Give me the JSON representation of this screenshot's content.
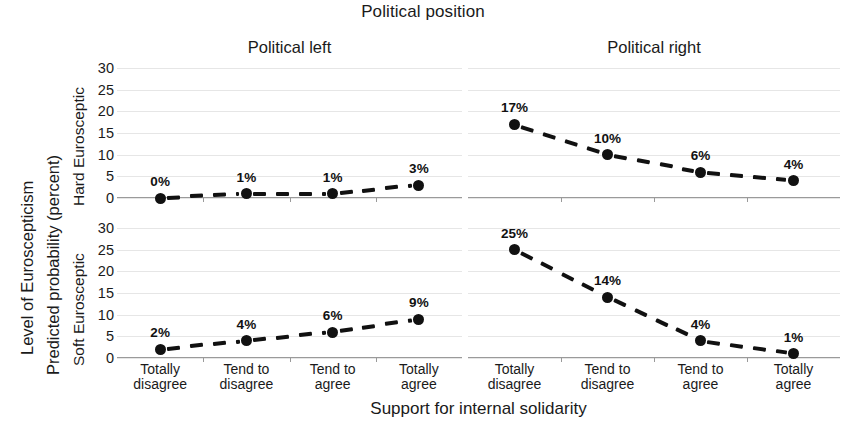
{
  "figure": {
    "title": "Political position",
    "x_axis_title": "Support for internal solidarity",
    "y_axis_title_outer": "Level of Euroscepticism",
    "y_axis_title_inner": "Predicted probability (percent)"
  },
  "panels": {
    "column_titles": [
      "Political left",
      "Political right"
    ],
    "row_titles": [
      "Hard Eurosceptic",
      "Soft Eurosceptic"
    ]
  },
  "axis": {
    "y_ticks": [
      "30",
      "25",
      "20",
      "15",
      "10",
      "5",
      "0"
    ],
    "x_ticks": [
      {
        "line1": "Totally",
        "line2": "disagree"
      },
      {
        "line1": "Tend to",
        "line2": "disagree"
      },
      {
        "line1": "Tend to",
        "line2": "agree"
      },
      {
        "line1": "Totally",
        "line2": "agree"
      }
    ]
  },
  "labels": {
    "hard_left": [
      "0%",
      "1%",
      "1%",
      "3%"
    ],
    "hard_right": [
      "17%",
      "10%",
      "6%",
      "4%"
    ],
    "soft_left": [
      "2%",
      "4%",
      "6%",
      "9%"
    ],
    "soft_right": [
      "25%",
      "14%",
      "4%",
      "1%"
    ]
  },
  "chart_data": {
    "type": "line",
    "title": "Political position",
    "xlabel": "Support for internal solidarity",
    "ylabel": "Level of Euroscepticism — Predicted probability (percent)",
    "categories": [
      "Totally disagree",
      "Tend to disagree",
      "Tend to agree",
      "Totally agree"
    ],
    "ylim": [
      0,
      30
    ],
    "yticks": [
      0,
      5,
      10,
      15,
      20,
      25,
      30
    ],
    "grid": true,
    "legend": "none",
    "layout": {
      "rows": [
        "Hard Eurosceptic",
        "Soft Eurosceptic"
      ],
      "cols": [
        "Political left",
        "Political right"
      ]
    },
    "panels": [
      {
        "row": "Hard Eurosceptic",
        "col": "Political left",
        "values": [
          0,
          1,
          1,
          3
        ],
        "labels": [
          "0%",
          "1%",
          "1%",
          "3%"
        ],
        "marker": "filled-circle",
        "linestyle": "dashed",
        "color": "#111111"
      },
      {
        "row": "Hard Eurosceptic",
        "col": "Political right",
        "values": [
          17,
          10,
          6,
          4
        ],
        "labels": [
          "17%",
          "10%",
          "6%",
          "4%"
        ],
        "marker": "filled-circle",
        "linestyle": "dashed",
        "color": "#111111"
      },
      {
        "row": "Soft Eurosceptic",
        "col": "Political left",
        "values": [
          2,
          4,
          6,
          9
        ],
        "labels": [
          "2%",
          "4%",
          "6%",
          "9%"
        ],
        "marker": "filled-circle",
        "linestyle": "dashed",
        "color": "#111111"
      },
      {
        "row": "Soft Eurosceptic",
        "col": "Political right",
        "values": [
          25,
          14,
          4,
          1
        ],
        "labels": [
          "25%",
          "14%",
          "4%",
          "1%"
        ],
        "marker": "filled-circle",
        "linestyle": "dashed",
        "color": "#111111"
      }
    ]
  }
}
